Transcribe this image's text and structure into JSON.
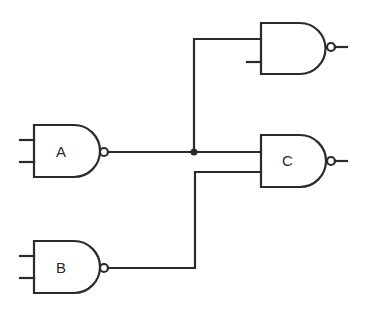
{
  "diagram": {
    "type": "logic-circuit",
    "stroke_color": "#2a2a2a",
    "background": "#ffffff",
    "gates": [
      {
        "id": "top",
        "kind": "NAND",
        "label": "",
        "inputs": 2
      },
      {
        "id": "A",
        "kind": "NAND",
        "label": "A",
        "inputs": 2
      },
      {
        "id": "C",
        "kind": "NAND",
        "label": "C",
        "inputs": 2
      },
      {
        "id": "B",
        "kind": "NAND",
        "label": "B",
        "inputs": 2
      }
    ],
    "connections": [
      {
        "from": "A.output",
        "to": "C.input1",
        "junction": true
      },
      {
        "from": "A.output",
        "to": "top.input1"
      },
      {
        "from": "B.output",
        "to": "C.input2"
      }
    ]
  }
}
